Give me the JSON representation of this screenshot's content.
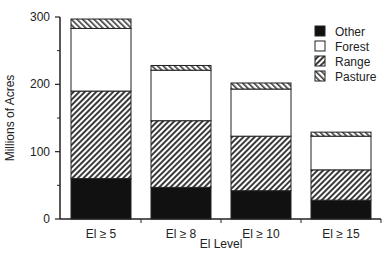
{
  "chart_data": {
    "type": "bar",
    "stacked": true,
    "title": "",
    "xlabel": "El Level",
    "ylabel": "Millions of Acres",
    "categories": [
      "El ≥ 5",
      "El ≥ 8",
      "El ≥ 10",
      "El ≥ 15"
    ],
    "series": [
      {
        "name": "Other",
        "values": [
          60,
          47,
          42,
          28
        ],
        "fill": "#111111",
        "pattern": "solid"
      },
      {
        "name": "Range",
        "values": [
          130,
          99,
          81,
          45
        ],
        "fill": "#666666",
        "pattern": "hatch-forward"
      },
      {
        "name": "Forest",
        "values": [
          93,
          75,
          70,
          50
        ],
        "fill": "#ffffff",
        "pattern": "solid"
      },
      {
        "name": "Pasture",
        "values": [
          14,
          7,
          9,
          6
        ],
        "fill": "#888888",
        "pattern": "hatch-back"
      }
    ],
    "totals": [
      297,
      228,
      202,
      129
    ],
    "ylim": [
      0,
      300
    ],
    "yticks": [
      0,
      100,
      200,
      300
    ],
    "yticks_minor": [
      50,
      150,
      250
    ],
    "grid": false,
    "legend": {
      "position": "upper right",
      "entries": [
        "Other",
        "Forest",
        "Range",
        "Pasture"
      ]
    }
  }
}
